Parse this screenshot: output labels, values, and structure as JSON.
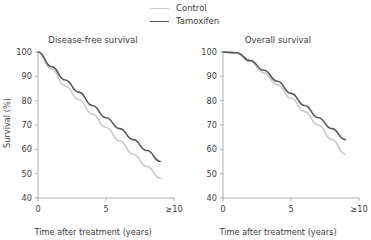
{
  "legend": {
    "position": "top-center",
    "items": [
      {
        "label": "Control",
        "color": "#c9c9c9"
      },
      {
        "label": "Tamoxifen",
        "color": "#5a5a5a"
      }
    ]
  },
  "axis": {
    "xlabel": "Time after treatment (years)",
    "ylabel": "Survival (%)",
    "xticks": [
      "0",
      "5",
      "≥10"
    ],
    "xtick_values": [
      0,
      5,
      10
    ],
    "yticks": [
      "40",
      "50",
      "60",
      "70",
      "80",
      "90",
      "100"
    ],
    "ytick_values": [
      40,
      50,
      60,
      70,
      80,
      90,
      100
    ],
    "xlim": [
      0,
      10
    ],
    "ylim": [
      40,
      100
    ]
  },
  "chart_data": [
    {
      "type": "line",
      "title": "Disease-free survival",
      "xlabel": "Time after treatment (years)",
      "ylabel": "Survival (%)",
      "xlim": [
        0,
        10
      ],
      "ylim": [
        40,
        100
      ],
      "xticks": [
        0,
        5,
        10
      ],
      "xticklabels": [
        "0",
        "5",
        "≥10"
      ],
      "yticks": [
        40,
        50,
        60,
        70,
        80,
        90,
        100
      ],
      "grid": false,
      "legend_position": "top-center",
      "x": [
        0,
        1,
        2,
        3,
        4,
        5,
        6,
        7,
        8,
        9
      ],
      "series": [
        {
          "name": "Control",
          "color": "#c9c9c9",
          "values": [
            100,
            93,
            86,
            80.5,
            74.5,
            69,
            63.5,
            58,
            53,
            48
          ]
        },
        {
          "name": "Tamoxifen",
          "color": "#5a5a5a",
          "values": [
            100,
            94,
            88.5,
            83.5,
            78,
            73,
            68.5,
            64,
            59.5,
            55
          ]
        }
      ]
    },
    {
      "type": "line",
      "title": "Overall survival",
      "xlabel": "Time after treatment (years)",
      "ylabel": "Survival (%)",
      "xlim": [
        0,
        10
      ],
      "ylim": [
        40,
        100
      ],
      "xticks": [
        0,
        5,
        10
      ],
      "xticklabels": [
        "0",
        "5",
        "≥10"
      ],
      "yticks": [
        40,
        50,
        60,
        70,
        80,
        90,
        100
      ],
      "grid": false,
      "legend_position": "top-center",
      "x": [
        0,
        1,
        2,
        3,
        4,
        5,
        6,
        7,
        8,
        9
      ],
      "series": [
        {
          "name": "Control",
          "color": "#c9c9c9",
          "values": [
            100,
            99.5,
            96,
            91.5,
            86.5,
            81,
            75.5,
            70,
            64,
            58
          ]
        },
        {
          "name": "Tamoxifen",
          "color": "#5a5a5a",
          "values": [
            100,
            99.7,
            96.5,
            92.5,
            88,
            83,
            78,
            73,
            68.5,
            64
          ]
        }
      ]
    }
  ]
}
